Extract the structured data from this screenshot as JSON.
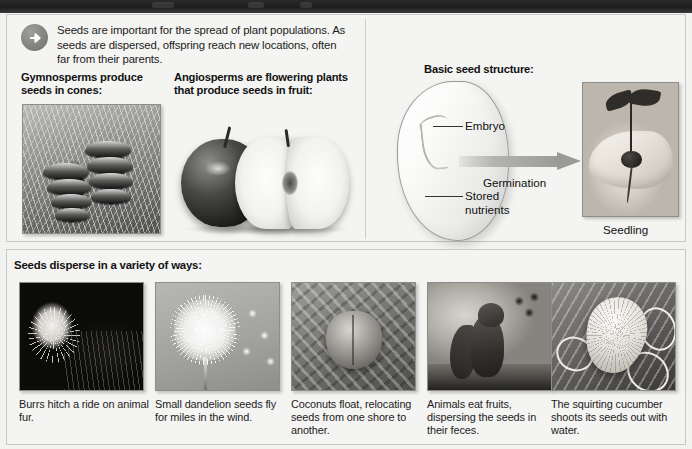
{
  "banner": {
    "present": true,
    "color": "#1d1d1d"
  },
  "intro": {
    "icon": "arrow-right-circle-icon",
    "text": "Seeds are important for the spread of plant populations. As seeds are dispersed, offspring reach new locations, often far from their parents."
  },
  "top_panel": {
    "gymnosperm_heading": "Gymnosperms produce seeds in cones:",
    "angiosperm_heading": "Angiosperms are flowering plants that produce seeds in fruit:",
    "seed_structure": {
      "heading": "Basic seed structure:",
      "labels": {
        "embryo": "Embryo",
        "stored_nutrients": "Stored nutrients",
        "germination": "Germination",
        "seedling": "Seedling"
      }
    },
    "images": {
      "cones": "pine-cones-photo",
      "apples": "apple-whole-and-halved-photo",
      "seed_diagram": "bean-seed-diagram",
      "seedling": "hand-holding-seedling-photo"
    }
  },
  "bottom_panel": {
    "heading": "Seeds disperse in a variety of ways:",
    "items": [
      {
        "image": "burr-on-animal-fur-photo",
        "caption": "Burrs hitch a ride on animal fur."
      },
      {
        "image": "dandelion-seed-head-photo",
        "caption": "Small dandelion seeds fly for miles in the wind."
      },
      {
        "image": "coconut-floating-photo",
        "caption": "Coconuts float, relocating seeds from one shore to another."
      },
      {
        "image": "squirrel-eating-berries-photo",
        "caption": "Animals eat fruits, dispersing the seeds in their feces."
      },
      {
        "image": "squirting-cucumber-photo",
        "caption": "The squirting cucumber shoots its seeds out with water."
      }
    ]
  },
  "colors": {
    "page_background": "#f2f2f0",
    "panel_background": "#f4f4f2",
    "panel_border": "#c9c9c4",
    "text": "#1c1c1c",
    "banner": "#1d1d1d",
    "arrow_badge": "#818180",
    "germination_arrow": "#9a9a97"
  }
}
